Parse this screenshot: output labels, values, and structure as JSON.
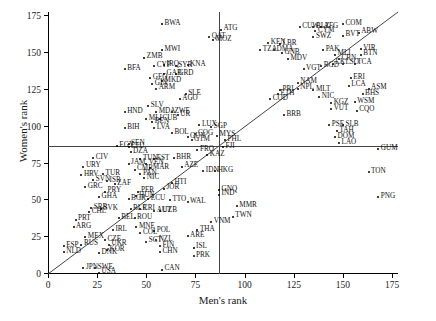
{
  "chart_data": {
    "type": "scatter",
    "title": "",
    "xlabel": "Men's rank",
    "ylabel": "Women's rank",
    "xlim": [
      0,
      178
    ],
    "ylim": [
      0,
      178
    ],
    "xticks": [
      0,
      25,
      50,
      75,
      100,
      125,
      150,
      175
    ],
    "yticks": [
      0,
      25,
      50,
      75,
      100,
      125,
      150,
      175
    ],
    "grid": false,
    "legend": null,
    "reference_lines": [
      {
        "name": "median-men-vertical",
        "orientation": "vertical",
        "value": 87
      },
      {
        "name": "median-women-horizontal",
        "orientation": "horizontal",
        "value": 86
      },
      {
        "name": "identity-diagonal",
        "orientation": "diagonal",
        "from": [
          0,
          0
        ],
        "to": [
          178,
          178
        ]
      }
    ],
    "point_label_field": "iso3",
    "points": [
      {
        "iso3": "BWA",
        "x": 58,
        "y": 170
      },
      {
        "iso3": "MWI",
        "x": 58,
        "y": 152
      },
      {
        "iso3": "BFA",
        "x": 39,
        "y": 139
      },
      {
        "iso3": "GEO",
        "x": 52,
        "y": 133
      },
      {
        "iso3": "GIN",
        "x": 53,
        "y": 129
      },
      {
        "iso3": "ARM",
        "x": 55,
        "y": 126
      },
      {
        "iso3": "HND",
        "x": 39,
        "y": 110
      },
      {
        "iso3": "BIH",
        "x": 39,
        "y": 99
      },
      {
        "iso3": "EGY",
        "x": 35,
        "y": 87
      },
      {
        "iso3": "SEN",
        "x": 41,
        "y": 88
      },
      {
        "iso3": "CIV",
        "x": 23,
        "y": 79
      },
      {
        "iso3": "URY",
        "x": 18,
        "y": 73
      },
      {
        "iso3": "HRV",
        "x": 17,
        "y": 67
      },
      {
        "iso3": "SVN",
        "x": 23,
        "y": 64
      },
      {
        "iso3": "TUR",
        "x": 28,
        "y": 68
      },
      {
        "iso3": "ISR",
        "x": 30,
        "y": 63
      },
      {
        "iso3": "ZAF",
        "x": 34,
        "y": 61
      },
      {
        "iso3": "GRC",
        "x": 19,
        "y": 59
      },
      {
        "iso3": "PRY",
        "x": 29,
        "y": 56
      },
      {
        "iso3": "GHA",
        "x": 26,
        "y": 52
      },
      {
        "iso3": "SRB",
        "x": 22,
        "y": 45
      },
      {
        "iso3": "CHL",
        "x": 21,
        "y": 42
      },
      {
        "iso3": "SVK",
        "x": 27,
        "y": 44
      },
      {
        "iso3": "PRT",
        "x": 14,
        "y": 37
      },
      {
        "iso3": "ARG",
        "x": 13,
        "y": 32
      },
      {
        "iso3": "MEX",
        "x": 19,
        "y": 25
      },
      {
        "iso3": "ESP",
        "x": 8,
        "y": 19
      },
      {
        "iso3": "NLD",
        "x": 8,
        "y": 15
      },
      {
        "iso3": "RUS",
        "x": 17,
        "y": 20
      },
      {
        "iso3": "CZE",
        "x": 29,
        "y": 23
      },
      {
        "iso3": "UKR",
        "x": 31,
        "y": 20
      },
      {
        "iso3": "KOR",
        "x": 30,
        "y": 16
      },
      {
        "iso3": "DNK",
        "x": 26,
        "y": 14
      },
      {
        "iso3": "JPN",
        "x": 18,
        "y": 4
      },
      {
        "iso3": "SWE",
        "x": 24,
        "y": 4
      },
      {
        "iso3": "USA",
        "x": 26,
        "y": 1
      },
      {
        "iso3": "DZA",
        "x": 42,
        "y": 83
      },
      {
        "iso3": "LTU",
        "x": 41,
        "y": 86
      },
      {
        "iso3": "JAM",
        "x": 41,
        "y": 75
      },
      {
        "iso3": "TUN",
        "x": 47,
        "y": 78
      },
      {
        "iso3": "VEN",
        "x": 50,
        "y": 75
      },
      {
        "iso3": "EST",
        "x": 54,
        "y": 78
      },
      {
        "iso3": "CMR",
        "x": 44,
        "y": 71
      },
      {
        "iso3": "PAN",
        "x": 47,
        "y": 68
      },
      {
        "iso3": "MAR",
        "x": 52,
        "y": 72
      },
      {
        "iso3": "NIC",
        "x": 49,
        "y": 65
      },
      {
        "iso3": "PER",
        "x": 46,
        "y": 56
      },
      {
        "iso3": "BGR",
        "x": 41,
        "y": 51
      },
      {
        "iso3": "HUN",
        "x": 45,
        "y": 53
      },
      {
        "iso3": "ECU",
        "x": 51,
        "y": 51
      },
      {
        "iso3": "BLR",
        "x": 42,
        "y": 44
      },
      {
        "iso3": "CRI",
        "x": 47,
        "y": 44
      },
      {
        "iso3": "AUT",
        "x": 54,
        "y": 43
      },
      {
        "iso3": "ROU",
        "x": 44,
        "y": 38
      },
      {
        "iso3": "MNE",
        "x": 45,
        "y": 32
      },
      {
        "iso3": "COL",
        "x": 47,
        "y": 28
      },
      {
        "iso3": "POL",
        "x": 54,
        "y": 29
      },
      {
        "iso3": "SCT",
        "x": 50,
        "y": 22
      },
      {
        "iso3": "NZL",
        "x": 55,
        "y": 23
      },
      {
        "iso3": "FIN",
        "x": 57,
        "y": 19
      },
      {
        "iso3": "CHN",
        "x": 57,
        "y": 15
      },
      {
        "iso3": "CAN",
        "x": 58,
        "y": 3
      },
      {
        "iso3": "BEL",
        "x": 36,
        "y": 38
      },
      {
        "iso3": "IRL",
        "x": 33,
        "y": 30
      },
      {
        "iso3": "AGO",
        "x": 67,
        "y": 119
      },
      {
        "iso3": "SLE",
        "x": 70,
        "y": 122
      },
      {
        "iso3": "ZMB",
        "x": 49,
        "y": 147
      },
      {
        "iso3": "CYP",
        "x": 54,
        "y": 141
      },
      {
        "iso3": "IRQ",
        "x": 59,
        "y": 142
      },
      {
        "iso3": "GAB",
        "x": 59,
        "y": 136
      },
      {
        "iso3": "MKD",
        "x": 58,
        "y": 131
      },
      {
        "iso3": "SYR",
        "x": 65,
        "y": 141
      },
      {
        "iso3": "GRD",
        "x": 65,
        "y": 136
      },
      {
        "iso3": "KNA",
        "x": 71,
        "y": 142
      },
      {
        "iso3": "QAT",
        "x": 82,
        "y": 161
      },
      {
        "iso3": "ATG",
        "x": 88,
        "y": 166
      },
      {
        "iso3": "MOZ",
        "x": 84,
        "y": 159
      },
      {
        "iso3": "SLV",
        "x": 51,
        "y": 114
      },
      {
        "iso3": "MDA",
        "x": 55,
        "y": 110
      },
      {
        "iso3": "MLI",
        "x": 50,
        "y": 105
      },
      {
        "iso3": "BEN",
        "x": 53,
        "y": 103
      },
      {
        "iso3": "CUB",
        "x": 57,
        "y": 105
      },
      {
        "iso3": "LVA",
        "x": 54,
        "y": 99
      },
      {
        "iso3": "ZWE",
        "x": 63,
        "y": 110
      },
      {
        "iso3": "UR",
        "x": 66,
        "y": 108
      },
      {
        "iso3": "BOL",
        "x": 63,
        "y": 96
      },
      {
        "iso3": "GUY",
        "x": 71,
        "y": 93
      },
      {
        "iso3": "GTM",
        "x": 73,
        "y": 91
      },
      {
        "iso3": "COG",
        "x": 75,
        "y": 95
      },
      {
        "iso3": "LUX",
        "x": 77,
        "y": 101
      },
      {
        "iso3": "SGP",
        "x": 83,
        "y": 100
      },
      {
        "iso3": "MYS",
        "x": 86,
        "y": 94
      },
      {
        "iso3": "PHL",
        "x": 90,
        "y": 91
      },
      {
        "iso3": "FJI",
        "x": 89,
        "y": 86
      },
      {
        "iso3": "FRO",
        "x": 76,
        "y": 84
      },
      {
        "iso3": "KAZ",
        "x": 81,
        "y": 81
      },
      {
        "iso3": "BHR",
        "x": 64,
        "y": 79
      },
      {
        "iso3": "AZE",
        "x": 68,
        "y": 73
      },
      {
        "iso3": "IDN",
        "x": 79,
        "y": 70
      },
      {
        "iso3": "HKG",
        "x": 85,
        "y": 70
      },
      {
        "iso3": "HTI",
        "x": 63,
        "y": 62
      },
      {
        "iso3": "JOR",
        "x": 59,
        "y": 58
      },
      {
        "iso3": "GNQ",
        "x": 87,
        "y": 57
      },
      {
        "iso3": "IND",
        "x": 87,
        "y": 54
      },
      {
        "iso3": "TTO",
        "x": 62,
        "y": 50
      },
      {
        "iso3": "WAL",
        "x": 71,
        "y": 49
      },
      {
        "iso3": "UZB",
        "x": 57,
        "y": 43
      },
      {
        "iso3": "MMR",
        "x": 96,
        "y": 46
      },
      {
        "iso3": "TWN",
        "x": 94,
        "y": 39
      },
      {
        "iso3": "VNM",
        "x": 83,
        "y": 35
      },
      {
        "iso3": "THA",
        "x": 76,
        "y": 30
      },
      {
        "iso3": "ARE",
        "x": 71,
        "y": 26
      },
      {
        "iso3": "ISL",
        "x": 74,
        "y": 18
      },
      {
        "iso3": "PRK",
        "x": 74,
        "y": 12
      },
      {
        "iso3": "KEN",
        "x": 112,
        "y": 157
      },
      {
        "iso3": "TZA",
        "x": 108,
        "y": 152
      },
      {
        "iso3": "LBR",
        "x": 118,
        "y": 156
      },
      {
        "iso3": "DMA",
        "x": 115,
        "y": 152
      },
      {
        "iso3": "GNB",
        "x": 119,
        "y": 150
      },
      {
        "iso3": "MDV",
        "x": 122,
        "y": 146
      },
      {
        "iso3": "CUW",
        "x": 128,
        "y": 168
      },
      {
        "iso3": "BLZ",
        "x": 135,
        "y": 168
      },
      {
        "iso3": "AFG",
        "x": 139,
        "y": 168
      },
      {
        "iso3": "CYM",
        "x": 136,
        "y": 165
      },
      {
        "iso3": "SWZ",
        "x": 135,
        "y": 161
      },
      {
        "iso3": "COM",
        "x": 150,
        "y": 170
      },
      {
        "iso3": "ABW",
        "x": 158,
        "y": 164
      },
      {
        "iso3": "BVT",
        "x": 150,
        "y": 162
      },
      {
        "iso3": "VIR",
        "x": 159,
        "y": 153
      },
      {
        "iso3": "BTN",
        "x": 159,
        "y": 149
      },
      {
        "iso3": "PAK",
        "x": 140,
        "y": 152
      },
      {
        "iso3": "MLI2",
        "x": 146,
        "y": 149
      },
      {
        "iso3": "CRN",
        "x": 148,
        "y": 146
      },
      {
        "iso3": "LK",
        "x": 145,
        "y": 143
      },
      {
        "iso3": "LSO",
        "x": 150,
        "y": 143
      },
      {
        "iso3": "TCA",
        "x": 156,
        "y": 143
      },
      {
        "iso3": "BGD",
        "x": 139,
        "y": 141
      },
      {
        "iso3": "VGT",
        "x": 130,
        "y": 139
      },
      {
        "iso3": "NAM",
        "x": 127,
        "y": 130
      },
      {
        "iso3": "NPL",
        "x": 127,
        "y": 126
      },
      {
        "iso3": "PRI",
        "x": 118,
        "y": 125
      },
      {
        "iso3": "ETH",
        "x": 117,
        "y": 122
      },
      {
        "iso3": "COD",
        "x": 113,
        "y": 119
      },
      {
        "iso3": "MLT",
        "x": 135,
        "y": 125
      },
      {
        "iso3": "NIC2",
        "x": 138,
        "y": 120
      },
      {
        "iso3": "ERI",
        "x": 154,
        "y": 133
      },
      {
        "iso3": "LCA",
        "x": 153,
        "y": 128
      },
      {
        "iso3": "ASM",
        "x": 163,
        "y": 126
      },
      {
        "iso3": "BHS",
        "x": 160,
        "y": 122
      },
      {
        "iso3": "WSM",
        "x": 156,
        "y": 117
      },
      {
        "iso3": "KGZ",
        "x": 144,
        "y": 116
      },
      {
        "iso3": "VUT",
        "x": 144,
        "y": 112
      },
      {
        "iso3": "CQO",
        "x": 157,
        "y": 111
      },
      {
        "iso3": "BRB",
        "x": 120,
        "y": 108
      },
      {
        "iso3": "PSE",
        "x": 143,
        "y": 101
      },
      {
        "iso3": "SLB",
        "x": 150,
        "y": 101
      },
      {
        "iso3": "TAH",
        "x": 147,
        "y": 97
      },
      {
        "iso3": "DOM",
        "x": 146,
        "y": 93
      },
      {
        "iso3": "LAO",
        "x": 148,
        "y": 89
      },
      {
        "iso3": "GUM",
        "x": 168,
        "y": 85
      },
      {
        "iso3": "TON",
        "x": 163,
        "y": 69
      },
      {
        "iso3": "PNG",
        "x": 168,
        "y": 52
      }
    ]
  },
  "figure": {
    "tick_label_suffix": "",
    "point_marker": "dot"
  }
}
